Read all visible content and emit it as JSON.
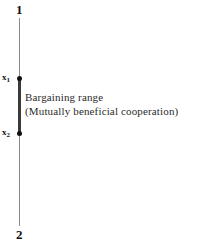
{
  "figure": {
    "type": "bargaining-range-diagram",
    "background_color": "#ffffff",
    "line_color": "#8a8a8a",
    "range_color": "#3a3a3a",
    "text_color": "#2b2b2b"
  },
  "actors": {
    "top_label": "1",
    "bottom_label": "2"
  },
  "axis_points": {
    "upper_bound_label": "x",
    "upper_bound_subscript": "1",
    "lower_bound_label": "x",
    "lower_bound_subscript": "2"
  },
  "annotation": {
    "line1": "Bargaining  range",
    "line2": "(Mutually  beneficial  cooperation)"
  }
}
